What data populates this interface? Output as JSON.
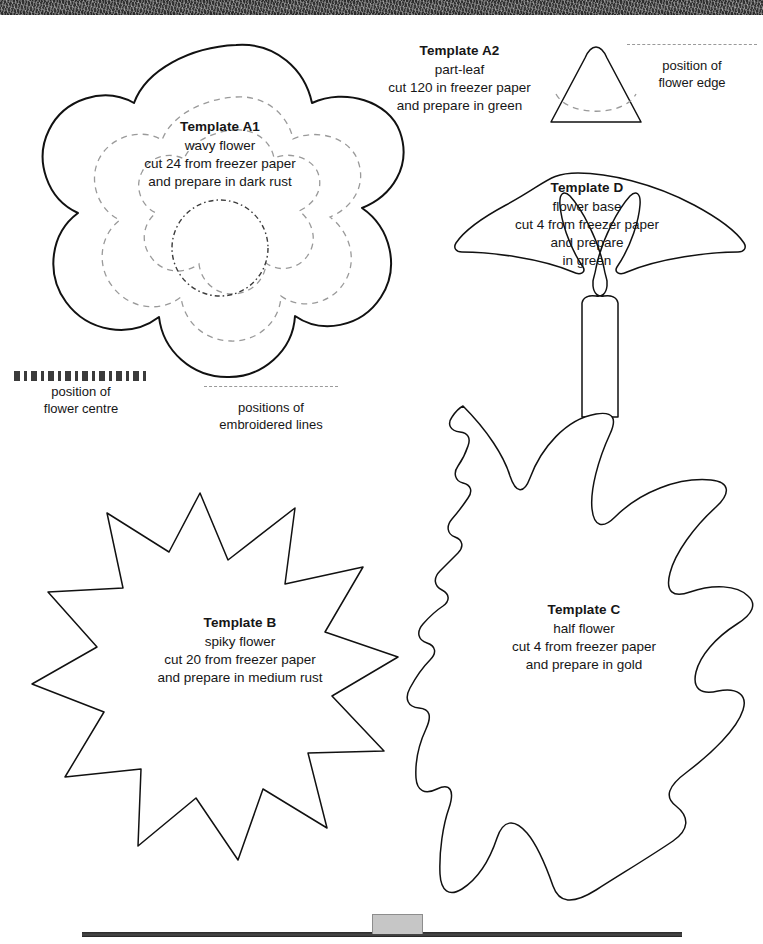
{
  "page": {
    "background_color": "#ffffff",
    "ink_color": "#111111",
    "guide_color": "#9a9a9a"
  },
  "templates": [
    {
      "id": "a1",
      "title": "Template A1",
      "line1": "wavy flower",
      "line2": "cut 24 from freezer paper",
      "line3": "and prepare in dark rust",
      "shape": "wavy-seven-lobe-flower"
    },
    {
      "id": "a2",
      "title": "Template A2",
      "line1": "part-leaf",
      "line2": "cut 120 in freezer paper",
      "line3": "and prepare in green",
      "shape": "rounded-triangle-part-leaf"
    },
    {
      "id": "d",
      "title": "Template D",
      "line1": "flower base",
      "line2": "cut 4 from freezer paper",
      "line3": "and prepare",
      "line4": "in green",
      "shape": "fan-with-two-leaves-and-stem"
    },
    {
      "id": "b",
      "title": "Template B",
      "line1": "spiky flower",
      "line2": "cut 20 from freezer paper",
      "line3": "and prepare in medium rust",
      "shape": "thirteen-point-star"
    },
    {
      "id": "c",
      "title": "Template C",
      "line1": "half flower",
      "line2": "cut 4 from freezer paper",
      "line3": "and prepare in gold",
      "shape": "irregular-half-flower"
    }
  ],
  "legends": [
    {
      "id": "flower-edge",
      "style": "dashed",
      "line1": "position of",
      "line2": "flower edge"
    },
    {
      "id": "flower-centre",
      "style": "dash-dot",
      "line1": "position of",
      "line2": "flower centre"
    },
    {
      "id": "embroidered-lines",
      "style": "dashed",
      "line1": "positions of",
      "line2": "embroidered lines"
    }
  ]
}
